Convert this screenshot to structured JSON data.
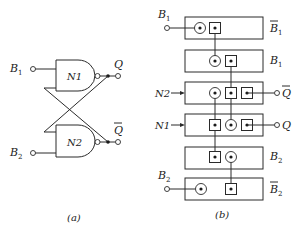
{
  "figure_a": {
    "caption": "(a)",
    "gates": [
      {
        "name": "N1",
        "type": "NAND"
      },
      {
        "name": "N2",
        "type": "NAND"
      }
    ],
    "inputs": [
      {
        "label": "B",
        "sub": "1",
        "overline": false
      },
      {
        "label": "B",
        "sub": "2",
        "overline": false
      }
    ],
    "outputs": [
      {
        "label": "Q",
        "overline": false
      },
      {
        "label": "Q",
        "overline": true
      }
    ]
  },
  "figure_b": {
    "caption": "(b)",
    "rows": [
      {
        "right_label": "B",
        "sub": "1",
        "overline": true
      },
      {
        "right_label": "B",
        "sub": "1",
        "overline": false
      },
      {
        "left_label": "N2",
        "output_label": "Q",
        "output_overline": true
      },
      {
        "left_label": "N1",
        "output_label": "Q",
        "output_overline": false
      },
      {
        "right_label": "B",
        "sub": "2",
        "overline": false
      },
      {
        "right_label": "B",
        "sub": "2",
        "overline": true
      }
    ],
    "inputs": [
      {
        "label": "B",
        "sub": "1"
      },
      {
        "label": "B",
        "sub": "2"
      }
    ]
  }
}
